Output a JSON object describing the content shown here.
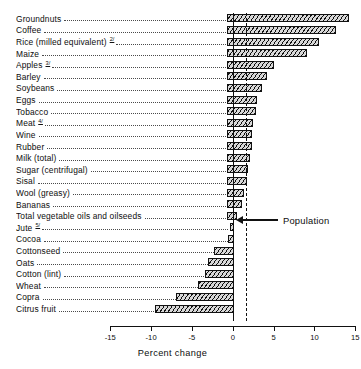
{
  "chart_data": {
    "type": "bar",
    "orientation": "horizontal",
    "title": "",
    "subtitle": "",
    "xlabel": "Percent change",
    "ylabel": "",
    "xlim": [
      -15,
      15
    ],
    "xticks": [
      -15,
      -10,
      -5,
      0,
      5,
      10,
      15
    ],
    "xtick_labels": [
      "-15",
      "-10",
      "-5",
      "0",
      "5",
      "10",
      "15"
    ],
    "grid": false,
    "legend": false,
    "reference_line": {
      "label": "Population",
      "value": 1.6
    },
    "categories": [
      "Groundnuts",
      "Coffee",
      "Rice (milled equivalent)",
      "Maize",
      "Apples",
      "Barley",
      "Soybeans",
      "Eggs",
      "Tobacco",
      "Meat",
      "Wine",
      "Rubber",
      "Milk (total)",
      "Sugar (centrifugal)",
      "Sisal",
      "Wool (greasy)",
      "Bananas",
      "Total vegetable oils and oilseeds",
      "Jute",
      "Cocoa",
      "Cottonseed",
      "Oats",
      "Cotton (lint)",
      "Wheat",
      "Copra",
      "Citrus fruit"
    ],
    "footnote_marks": [
      "",
      "",
      "2/",
      "",
      "3/",
      "",
      "",
      "",
      "",
      "4/",
      "",
      "",
      "",
      "",
      "",
      "",
      "",
      "",
      "5/",
      "",
      "",
      "",
      "",
      "",
      "",
      ""
    ],
    "values": [
      14.2,
      12.6,
      10.6,
      9.1,
      5.0,
      4.2,
      3.6,
      3.0,
      2.8,
      2.5,
      2.4,
      2.3,
      2.1,
      1.9,
      1.7,
      1.4,
      1.1,
      0.5,
      -0.4,
      -0.6,
      -2.3,
      -3.0,
      -3.4,
      -4.3,
      -7.0,
      -9.5
    ]
  },
  "axis": {
    "title": "Percent change"
  },
  "annotation": {
    "population_label": "Population"
  }
}
